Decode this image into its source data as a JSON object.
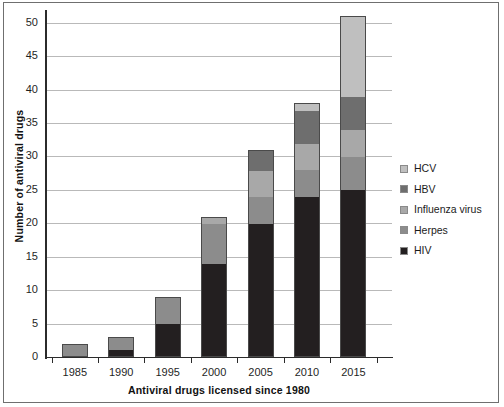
{
  "chart_data": {
    "type": "bar",
    "stacked": true,
    "title": "",
    "xlabel": "Antiviral drugs licensed since 1980",
    "ylabel": "Number of antiviral drugs",
    "categories": [
      "1985",
      "1990",
      "1995",
      "2000",
      "2005",
      "2010",
      "2015"
    ],
    "series": [
      {
        "name": "HIV",
        "color": "#231f20",
        "values": [
          0,
          1,
          5,
          14,
          20,
          24,
          25
        ]
      },
      {
        "name": "Herpes",
        "color": "#8c8c8c",
        "values": [
          2,
          2,
          4,
          6,
          4,
          4,
          5
        ]
      },
      {
        "name": "Influenza virus",
        "color": "#a8a8a8",
        "values": [
          0,
          0,
          0,
          1,
          4,
          4,
          4
        ]
      },
      {
        "name": "HBV",
        "color": "#6e6e6e",
        "values": [
          0,
          0,
          0,
          0,
          3,
          5,
          5
        ]
      },
      {
        "name": "HCV",
        "color": "#bfbfbf",
        "values": [
          0,
          0,
          0,
          0,
          0,
          1,
          12
        ]
      }
    ],
    "totals": [
      2,
      3,
      9,
      21,
      31,
      38,
      51
    ],
    "ylim": [
      0,
      51.6
    ],
    "yticks": [
      "0",
      "5",
      "10",
      "15",
      "20",
      "25",
      "30",
      "35",
      "40",
      "45",
      "50"
    ],
    "ytick_values": [
      0,
      5,
      10,
      15,
      20,
      25,
      30,
      35,
      40,
      45,
      50
    ],
    "grid": true,
    "legend_position": "right",
    "legend_order_top_to_bottom": [
      "HCV",
      "HBV",
      "Influenza virus",
      "Herpes",
      "HIV"
    ]
  },
  "legend": {
    "items": [
      {
        "label": "HCV",
        "color": "#bfbfbf"
      },
      {
        "label": "HBV",
        "color": "#6e6e6e"
      },
      {
        "label": "Influenza virus",
        "color": "#a8a8a8"
      },
      {
        "label": "Herpes",
        "color": "#8c8c8c"
      },
      {
        "label": "HIV",
        "color": "#231f20"
      }
    ]
  }
}
